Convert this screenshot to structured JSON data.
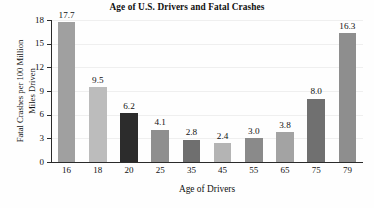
{
  "chart_data": {
    "type": "bar",
    "title": "Age of U.S. Drivers and Fatal Crashes",
    "xlabel": "Age of Drivers",
    "ylabel_lines": [
      "Fatal Crashes per 100 Million",
      "Miles Driven"
    ],
    "ylabel": "Fatal Crashes per 100 Million Miles Driven",
    "categories": [
      "16",
      "18",
      "20",
      "25",
      "35",
      "45",
      "55",
      "65",
      "75",
      "79"
    ],
    "values": [
      17.7,
      9.5,
      6.2,
      4.1,
      2.8,
      2.4,
      3.0,
      3.8,
      8.0,
      16.3
    ],
    "value_labels": [
      "17.7",
      "9.5",
      "6.2",
      "4.1",
      "2.8",
      "2.4",
      "3.0",
      "3.8",
      "8.0",
      "16.3"
    ],
    "bar_colors": [
      "#a0a0a0",
      "#bcbcbc",
      "#2c2c2c",
      "#8f8f8f",
      "#6f6f6f",
      "#b4b4b4",
      "#8a8a8a",
      "#a3a3a3",
      "#707070",
      "#8e8e8e"
    ],
    "ylim": [
      0,
      18
    ],
    "yticks": [
      0,
      3,
      6,
      9,
      12,
      15,
      18
    ],
    "ytick_labels": [
      "0",
      "3",
      "6",
      "9",
      "12",
      "15",
      "18"
    ],
    "grid": true,
    "legend": null
  }
}
